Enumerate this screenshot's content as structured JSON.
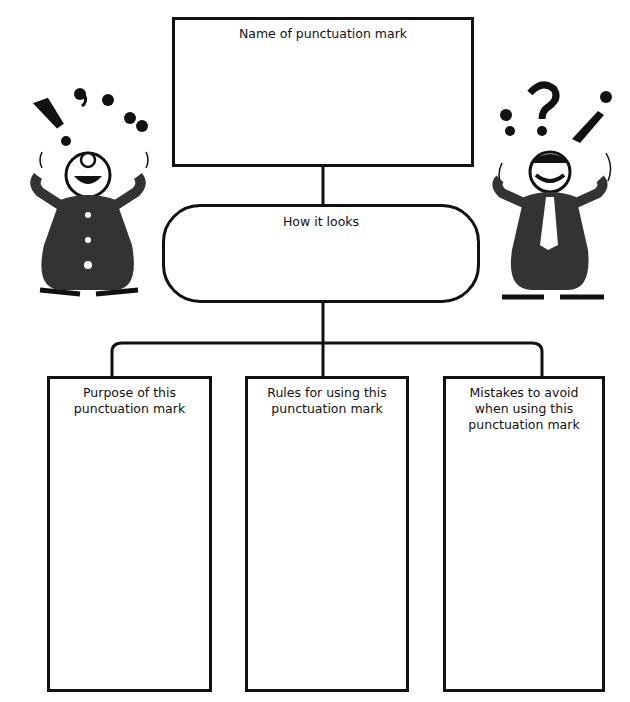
{
  "diagram": {
    "type": "graphic-organizer",
    "top_box": {
      "label": "Name of punctuation mark"
    },
    "middle_box": {
      "label": "How it looks",
      "shape": "rounded-oval"
    },
    "bottom_boxes": [
      {
        "label": "Purpose of this punctuation mark"
      },
      {
        "label": "Rules for using this punctuation mark"
      },
      {
        "label": "Mistakes to avoid when using this punctuation mark"
      }
    ],
    "illustrations": [
      {
        "name": "left-clown",
        "juggling": [
          "!",
          ",",
          ".",
          "“"
        ]
      },
      {
        "name": "right-clown",
        "juggling": [
          ";",
          "?",
          "¡"
        ]
      }
    ],
    "colors": {
      "ink": "#111111",
      "background": "#ffffff"
    }
  }
}
